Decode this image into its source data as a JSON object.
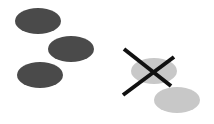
{
  "diagram": {
    "colors": {
      "background": "#ffffff",
      "dark_ellipse": "#4a4a4a",
      "light_ellipse": "#c8c8c8",
      "cross": "#111111"
    },
    "dark_ellipses": [
      {
        "cx": 38,
        "cy": 21,
        "rx": 23,
        "ry": 13
      },
      {
        "cx": 71,
        "cy": 49,
        "rx": 23,
        "ry": 13
      },
      {
        "cx": 40,
        "cy": 75,
        "rx": 23,
        "ry": 13
      }
    ],
    "light_ellipses": [
      {
        "cx": 154,
        "cy": 71,
        "rx": 23,
        "ry": 13
      },
      {
        "cx": 177,
        "cy": 100,
        "rx": 23,
        "ry": 13
      }
    ],
    "cross": {
      "line1": {
        "x1": 124,
        "y1": 49,
        "x2": 171,
        "y2": 86
      },
      "line2": {
        "x1": 123,
        "y1": 95,
        "x2": 174,
        "y2": 57
      }
    }
  }
}
